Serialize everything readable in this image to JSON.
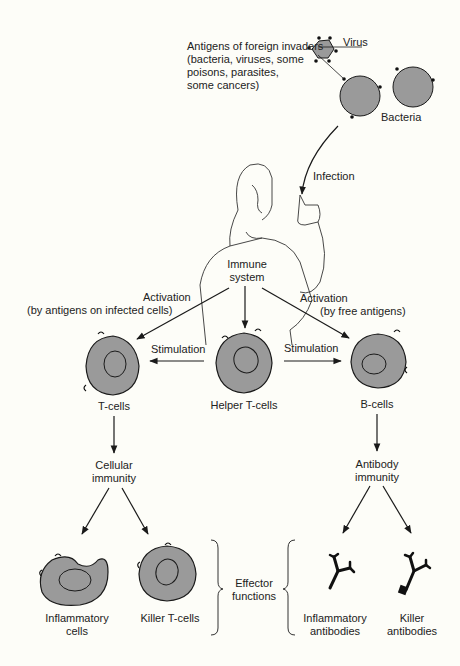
{
  "colors": {
    "background": "#fdfdf8",
    "cell_fill": "#9a9a9a",
    "ink": "#1a1a1a"
  },
  "top": {
    "antigens_label": [
      "Antigens of foreign invaders",
      "(bacteria, viruses, some",
      "poisons, parasites,",
      "some cancers)"
    ],
    "virus_label": "Virus",
    "bacteria_label": "Bacteria",
    "infection_label": "Infection"
  },
  "center": {
    "immune_system_label": [
      "Immune",
      "system"
    ],
    "activation_left": [
      "Activation",
      "(by antigens on infected cells)"
    ],
    "activation_right": [
      "Activation",
      "(by free antigens)"
    ],
    "stimulation_left": "Stimulation",
    "stimulation_right": "Stimulation"
  },
  "cells": {
    "t_cells": "T-cells",
    "helper_t_cells": "Helper T-cells",
    "b_cells": "B-cells"
  },
  "immunity": {
    "cellular": [
      "Cellular",
      "immunity"
    ],
    "antibody": [
      "Antibody",
      "immunity"
    ]
  },
  "effectors": {
    "inflammatory_cells": [
      "Inflammatory",
      "cells"
    ],
    "killer_t_cells": "Killer T-cells",
    "effector_functions": [
      "Effector",
      "functions"
    ],
    "inflammatory_antibodies": [
      "Inflammatory",
      "antibodies"
    ],
    "killer_antibodies": [
      "Killer",
      "antibodies"
    ]
  }
}
